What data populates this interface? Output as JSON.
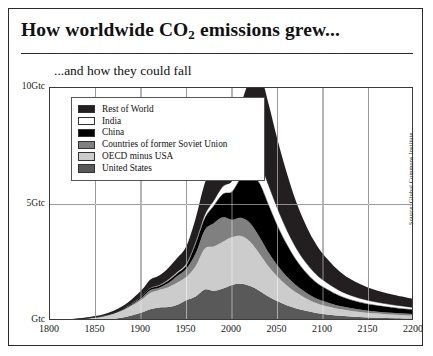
{
  "header": {
    "title_prefix": "How worldwide CO",
    "title_sub": "2",
    "title_suffix": " emissions grew...",
    "subtitle": "...and how they could fall"
  },
  "source_note": "Source: Global Commons Institute",
  "legend": {
    "items": [
      {
        "label": "Rest of World",
        "color": "#231f20"
      },
      {
        "label": "India",
        "color": "#ffffff"
      },
      {
        "label": "China",
        "color": "#000000"
      },
      {
        "label": "Countries of former Soviet Union",
        "color": "#808080"
      },
      {
        "label": "OECD minus USA",
        "color": "#cccccc"
      },
      {
        "label": "United States",
        "color": "#595959"
      }
    ]
  },
  "chart_data": {
    "type": "area",
    "title": "How worldwide CO2 emissions grew...",
    "subtitle": "...and how they could fall",
    "xlabel": "",
    "ylabel": "Gtc",
    "xlim": [
      1800,
      2200
    ],
    "ylim": [
      0,
      10
    ],
    "xticks": [
      1800,
      1850,
      1900,
      1950,
      2000,
      2050,
      2100,
      2150,
      2200
    ],
    "xtick_labels": [
      "1800",
      "1850",
      "1900",
      "1950",
      "2000",
      "2050",
      "2100",
      "2150",
      "2200"
    ],
    "yticks": [
      0,
      5,
      10
    ],
    "ytick_labels": [
      "Gtc",
      "5Gtc",
      "10Gtc"
    ],
    "grid": true,
    "legend_position": "upper-left",
    "stacked": true,
    "stack_order_bottom_to_top": [
      "United States",
      "OECD minus USA",
      "Countries of former Soviet Union",
      "China",
      "India",
      "Rest of World"
    ],
    "x": [
      1800,
      1820,
      1840,
      1860,
      1880,
      1900,
      1910,
      1920,
      1930,
      1940,
      1950,
      1960,
      1970,
      1980,
      1990,
      2000,
      2010,
      2020,
      2030,
      2040,
      2050,
      2060,
      2070,
      2080,
      2090,
      2100,
      2120,
      2140,
      2160,
      2180,
      2200
    ],
    "series": [
      {
        "name": "United States",
        "color": "#595959",
        "values": [
          0.0,
          0.0,
          0.02,
          0.05,
          0.15,
          0.35,
          0.5,
          0.58,
          0.6,
          0.7,
          0.9,
          1.05,
          1.35,
          1.3,
          1.4,
          1.55,
          1.6,
          1.5,
          1.3,
          1.05,
          0.85,
          0.68,
          0.55,
          0.45,
          0.36,
          0.3,
          0.22,
          0.17,
          0.14,
          0.12,
          0.1
        ]
      },
      {
        "name": "OECD minus USA",
        "color": "#cccccc",
        "values": [
          0.02,
          0.04,
          0.08,
          0.15,
          0.3,
          0.55,
          0.7,
          0.75,
          0.85,
          0.95,
          1.0,
          1.3,
          1.75,
          1.9,
          2.0,
          2.05,
          2.05,
          1.9,
          1.6,
          1.3,
          1.05,
          0.85,
          0.68,
          0.55,
          0.45,
          0.38,
          0.28,
          0.22,
          0.18,
          0.15,
          0.13
        ]
      },
      {
        "name": "Countries of former Soviet Union",
        "color": "#808080",
        "values": [
          0.0,
          0.0,
          0.0,
          0.01,
          0.03,
          0.08,
          0.12,
          0.1,
          0.18,
          0.28,
          0.35,
          0.55,
          0.8,
          1.0,
          1.05,
          0.75,
          0.78,
          0.8,
          0.72,
          0.6,
          0.48,
          0.39,
          0.32,
          0.26,
          0.21,
          0.18,
          0.13,
          0.1,
          0.08,
          0.07,
          0.06
        ]
      },
      {
        "name": "China",
        "color": "#000000",
        "values": [
          0.01,
          0.01,
          0.02,
          0.02,
          0.03,
          0.05,
          0.07,
          0.08,
          0.1,
          0.12,
          0.15,
          0.4,
          0.5,
          0.75,
          1.0,
          1.2,
          1.7,
          2.1,
          2.3,
          2.05,
          1.7,
          1.38,
          1.1,
          0.88,
          0.72,
          0.6,
          0.42,
          0.32,
          0.26,
          0.22,
          0.19
        ]
      },
      {
        "name": "India",
        "color": "#ffffff",
        "values": [
          0.0,
          0.0,
          0.0,
          0.01,
          0.01,
          0.02,
          0.03,
          0.04,
          0.05,
          0.06,
          0.08,
          0.1,
          0.15,
          0.22,
          0.33,
          0.45,
          0.6,
          0.78,
          0.9,
          0.85,
          0.75,
          0.63,
          0.52,
          0.43,
          0.36,
          0.3,
          0.22,
          0.17,
          0.14,
          0.12,
          0.1
        ]
      },
      {
        "name": "Rest of World",
        "color": "#231f20",
        "values": [
          0.01,
          0.02,
          0.03,
          0.06,
          0.12,
          0.25,
          0.35,
          0.4,
          0.5,
          0.6,
          0.75,
          1.0,
          1.35,
          1.6,
          1.85,
          2.1,
          2.6,
          3.3,
          3.85,
          3.5,
          2.95,
          2.45,
          2.0,
          1.65,
          1.35,
          1.12,
          0.8,
          0.62,
          0.5,
          0.42,
          0.36
        ]
      }
    ],
    "total_peak": {
      "year": 2030,
      "value": 9.9
    }
  }
}
